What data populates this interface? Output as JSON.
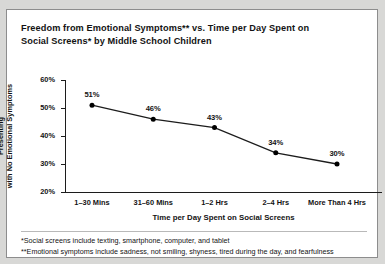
{
  "figure": {
    "title": "Freedom from Emotional Symptoms** vs. Time per Day Spent on Social Screens* by Middle School Children",
    "title_line1": "Freedom from Emotional Symptoms** vs. Time per Day Spent on",
    "title_line2": "Social Screens* by Middle School Children",
    "ylabel_line1": "Percentage of Children Presenting",
    "ylabel_line2": "with No Emotional Symptoms",
    "xlabel": "Time per Day Spent on Social Screens",
    "footnotes": [
      "*Social screens include texting, smartphone, computer, and tablet",
      "**Emotional symptoms include sadness, not smiling, shyness, tired during the day, and fearfulness"
    ],
    "colors": {
      "line": "#1c1c1c",
      "marker": "#000000",
      "axis": "#1c1c1c",
      "text": "#131313",
      "panel_background": "#ffffff",
      "page_background": "#d8d8d6",
      "border": "#8d8d8d"
    }
  },
  "chart_data": {
    "type": "line",
    "title": "Freedom from Emotional Symptoms** vs. Time per Day Spent on Social Screens* by Middle School Children",
    "subtitle": "",
    "xlabel": "Time per Day Spent on Social Screens",
    "ylabel": "Percentage of Children Presenting with No Emotional Symptoms",
    "categories": [
      "1–30 Mins",
      "31–60 Mins",
      "1–2 Hrs",
      "2–4 Hrs",
      "More Than 4 Hrs"
    ],
    "values": [
      51,
      46,
      43,
      34,
      30
    ],
    "point_labels": [
      "51%",
      "46%",
      "43%",
      "34%",
      "30%"
    ],
    "ylim": [
      20,
      60
    ],
    "yticks": [
      20,
      30,
      40,
      50,
      60
    ],
    "ytick_labels": [
      "20%",
      "30%",
      "40%",
      "50%",
      "60%"
    ],
    "grid": false,
    "legend": false,
    "legend_position": "none",
    "markers": true,
    "annotations": [
      "*Social screens include texting, smartphone, computer, and tablet",
      "**Emotional symptoms include sadness, not smiling, shyness, tired during the day, and fearfulness"
    ]
  }
}
